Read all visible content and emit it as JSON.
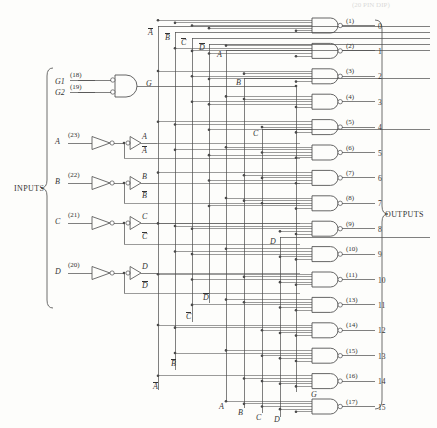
{
  "diagram": {
    "title_faint": "(20 PIN DIP)",
    "inputs_group_label": "INPUTS",
    "outputs_group_label": "OUTPUTS"
  },
  "enable_gate": {
    "inputs": [
      {
        "name": "G1",
        "pin": "(18)"
      },
      {
        "name": "G2",
        "pin": "(19)"
      }
    ],
    "output_label": "G",
    "type": "and-gate-inverted-inputs"
  },
  "data_inputs": [
    {
      "name": "A",
      "pin": "(23)",
      "true_label": "A",
      "comp_label": "A"
    },
    {
      "name": "B",
      "pin": "(22)",
      "true_label": "B",
      "comp_label": "B"
    },
    {
      "name": "C",
      "pin": "(21)",
      "true_label": "C",
      "comp_label": "C"
    },
    {
      "name": "D",
      "pin": "(20)",
      "true_label": "D",
      "comp_label": "D"
    }
  ],
  "bus_labels": {
    "top": [
      "A",
      "B",
      "C",
      "D"
    ],
    "top_overbar": [
      true,
      true,
      true,
      true
    ],
    "top_inner": [
      "A",
      "B",
      "C",
      "D"
    ],
    "left_bottom": [
      "D",
      "C",
      "B",
      "A"
    ],
    "left_bottom_overbar": [
      true,
      true,
      true,
      true
    ],
    "bottom": [
      "A",
      "B",
      "C",
      "D"
    ],
    "enable": "G"
  },
  "outputs": [
    {
      "pin": "(1)",
      "index": "0"
    },
    {
      "pin": "(2)",
      "index": "1"
    },
    {
      "pin": "(3)",
      "index": "2"
    },
    {
      "pin": "(4)",
      "index": "3"
    },
    {
      "pin": "(5)",
      "index": "4"
    },
    {
      "pin": "(6)",
      "index": "5"
    },
    {
      "pin": "(7)",
      "index": "6"
    },
    {
      "pin": "(8)",
      "index": "7"
    },
    {
      "pin": "(9)",
      "index": "8"
    },
    {
      "pin": "(10)",
      "index": "9"
    },
    {
      "pin": "(11)",
      "index": "10"
    },
    {
      "pin": "(13)",
      "index": "11"
    },
    {
      "pin": "(14)",
      "index": "12"
    },
    {
      "pin": "(15)",
      "index": "13"
    },
    {
      "pin": "(16)",
      "index": "14"
    },
    {
      "pin": "(17)",
      "index": "15"
    }
  ],
  "style": {
    "line_color": "#4a4a4a",
    "text_color": "#333333",
    "background": "#fdfdfb"
  }
}
